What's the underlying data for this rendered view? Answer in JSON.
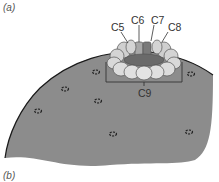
{
  "figure": {
    "panel_labels": [
      "(a)",
      "(b)"
    ],
    "cell_labels": [
      "C5",
      "C6",
      "C7",
      "C8"
    ],
    "bracket_label": "C9"
  },
  "colors": {
    "leaf_fill": "#8c8c8c",
    "leaf_edge": "#1a1a1a",
    "guard_cell_light": "#d4d4d4",
    "guard_cell_mid": "#a8a8a8",
    "guard_cell_dark": "#7a7a7a",
    "stoma": "#222222"
  },
  "stomata": [
    {
      "x": 96,
      "y": 72
    },
    {
      "x": 65,
      "y": 89
    },
    {
      "x": 98,
      "y": 101
    },
    {
      "x": 38,
      "y": 111
    },
    {
      "x": 113,
      "y": 134
    },
    {
      "x": 189,
      "y": 132
    },
    {
      "x": 191,
      "y": 74
    }
  ]
}
